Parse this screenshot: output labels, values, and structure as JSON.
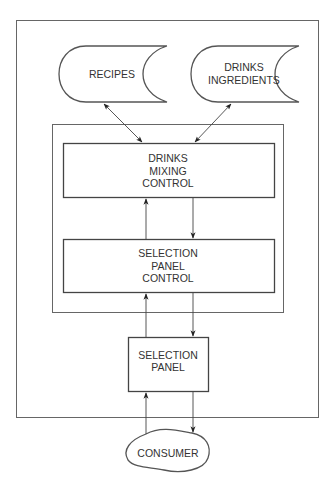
{
  "diagram": {
    "type": "block-diagram",
    "nodes": {
      "recipes": {
        "lines": [
          "RECIPES"
        ],
        "shape": "data-store"
      },
      "drinks_ingredients": {
        "lines": [
          "DRINKS",
          "INGREDIENTS"
        ],
        "shape": "data-store"
      },
      "drinks_mixing_control": {
        "lines": [
          "DRINKS",
          "MIXING",
          "CONTROL"
        ],
        "shape": "rectangle"
      },
      "selection_panel_control": {
        "lines": [
          "SELECTION",
          "PANEL",
          "CONTROL"
        ],
        "shape": "rectangle"
      },
      "selection_panel": {
        "lines": [
          "SELECTION",
          "PANEL"
        ],
        "shape": "rectangle"
      },
      "consumer": {
        "lines": [
          "CONSUMER"
        ],
        "shape": "cloud"
      }
    },
    "edges": [
      {
        "from": "recipes",
        "to": "drinks_mixing_control",
        "direction": "bidirectional"
      },
      {
        "from": "drinks_ingredients",
        "to": "drinks_mixing_control",
        "direction": "bidirectional"
      },
      {
        "from": "drinks_mixing_control",
        "to": "selection_panel_control",
        "direction": "forward"
      },
      {
        "from": "selection_panel_control",
        "to": "drinks_mixing_control",
        "direction": "forward"
      },
      {
        "from": "selection_panel_control",
        "to": "selection_panel",
        "direction": "forward"
      },
      {
        "from": "selection_panel",
        "to": "selection_panel_control",
        "direction": "forward"
      },
      {
        "from": "selection_panel",
        "to": "consumer",
        "direction": "forward"
      },
      {
        "from": "consumer",
        "to": "selection_panel",
        "direction": "forward"
      }
    ],
    "colors": {
      "line": "#444444",
      "text": "#333333",
      "background": "#ffffff"
    }
  }
}
